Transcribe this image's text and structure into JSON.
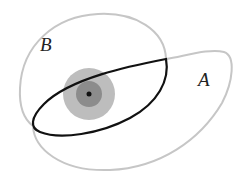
{
  "diagram": {
    "title": "",
    "labels": {
      "A": "A",
      "B": "B"
    },
    "regions": [
      {
        "name": "region-A",
        "label": "A",
        "stroke": "#c4c4c4"
      },
      {
        "name": "region-B",
        "label": "B",
        "stroke": "#c4c4c4"
      },
      {
        "name": "intersection-A-B",
        "stroke": "#111111"
      }
    ],
    "point": {
      "outer_fill": "#bdbdbd",
      "middle_fill": "#8a8a8a",
      "center_fill": "#111111"
    }
  }
}
